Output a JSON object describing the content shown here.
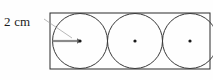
{
  "figure": {
    "kind": "geometry-diagram",
    "background_color": "#fefefe",
    "labels": {
      "radius_label": "2 cm"
    },
    "colors": {
      "outline": "#2b2b2b",
      "circle_stroke": "#3a3a3a",
      "radius_arrow": "#8a8a8a",
      "leader_line": "#9a9a9a",
      "center_dot": "#1a1a1a",
      "text": "#1b1b1b"
    },
    "rectangle": {
      "x": 50,
      "y": 13,
      "width": 160,
      "height": 56
    },
    "circles": [
      {
        "cx": 80,
        "cy": 41,
        "r": 27.5,
        "has_center_dot": true,
        "has_radius_arrow": true
      },
      {
        "cx": 135,
        "cy": 41,
        "r": 27.5,
        "has_center_dot": true,
        "has_radius_arrow": false
      },
      {
        "cx": 190,
        "cy": 41,
        "r": 27.5,
        "has_center_dot": true,
        "has_radius_arrow": false
      }
    ],
    "radius_arrow": {
      "from_x": 52.5,
      "from_y": 41,
      "to_x": 80,
      "to_y": 41,
      "length_label": "2 cm"
    },
    "leader_line": {
      "from_x": 44,
      "from_y": 19,
      "to_x": 72,
      "to_y": 38
    }
  }
}
